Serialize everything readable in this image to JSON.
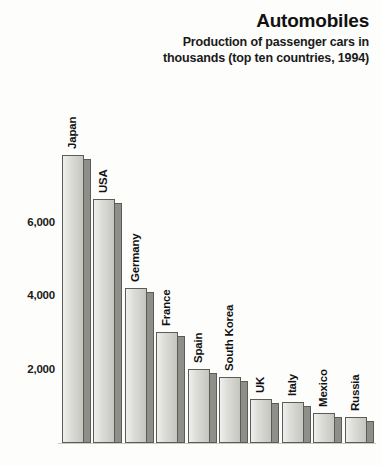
{
  "header": {
    "title": "Automobiles",
    "subtitle": "Production of passenger cars in thousands (top ten countries, 1994)"
  },
  "axis": {
    "y_ticks": [
      "2,000",
      "4,000",
      "6,000"
    ]
  },
  "colors": {
    "bar_front": "#dcdcd8",
    "bar_side": "#8f8f8a",
    "bar_outline": "#5b5b58",
    "text": "#111111",
    "background": "#fdfdfc"
  },
  "chart_data": {
    "type": "bar",
    "title": "Automobiles",
    "subtitle": "Production of passenger cars in thousands (top ten countries, 1994)",
    "xlabel": "",
    "ylabel": "",
    "ylim": [
      0,
      8000
    ],
    "grid": false,
    "legend": false,
    "yticks": [
      2000,
      4000,
      6000
    ],
    "ytick_labels": [
      "2,000",
      "4,000",
      "6,000"
    ],
    "units": "thousands of cars",
    "categories": [
      "Japan",
      "USA",
      "Germany",
      "France",
      "Spain",
      "South Korea",
      "UK",
      "Italy",
      "Mexico",
      "Russia"
    ],
    "values": [
      7800,
      6600,
      4200,
      3000,
      2000,
      1800,
      1200,
      1100,
      800,
      700
    ],
    "bars": [
      {
        "label": "Japan",
        "value": 7800
      },
      {
        "label": "USA",
        "value": 6600
      },
      {
        "label": "Germany",
        "value": 4200
      },
      {
        "label": "France",
        "value": 3000
      },
      {
        "label": "Spain",
        "value": 2000
      },
      {
        "label": "South Korea",
        "value": 1800
      },
      {
        "label": "UK",
        "value": 1200
      },
      {
        "label": "Italy",
        "value": 1100
      },
      {
        "label": "Mexico",
        "value": 800
      },
      {
        "label": "Russia",
        "value": 700
      }
    ]
  }
}
